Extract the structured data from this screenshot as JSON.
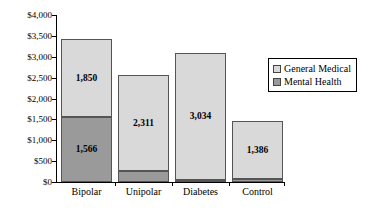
{
  "chart_data": {
    "type": "bar",
    "stacked": true,
    "title": "",
    "subtitle": "",
    "xlabel": "",
    "ylabel": "",
    "categories": [
      "Bipolar",
      "Unipolar",
      "Diabetes",
      "Control"
    ],
    "series": [
      {
        "name": "Mental Health",
        "color": "#9a9a9a",
        "values": [
          1566,
          259,
          49,
          76
        ],
        "labels": [
          "1,566",
          "259",
          "49",
          "76"
        ]
      },
      {
        "name": "General Medical",
        "color": "#d9d9d9",
        "values": [
          1850,
          2311,
          3034,
          1386
        ],
        "labels": [
          "1,850",
          "2,311",
          "3,034",
          "1,386"
        ]
      }
    ],
    "totals": [
      3416,
      2570,
      3083,
      1462
    ],
    "ylim": [
      0,
      4000
    ],
    "ytick_step": 500,
    "ytick_labels": [
      "$4,000",
      "$3,500",
      "$3,000",
      "$2,500",
      "$2,000",
      "$1,500",
      "$1,000",
      "$500",
      "$0"
    ],
    "ytick_values": [
      4000,
      3500,
      3000,
      2500,
      2000,
      1500,
      1000,
      500,
      0
    ],
    "grid": false,
    "legend_position": "right"
  },
  "legend": {
    "entries": [
      {
        "label": "General Medical",
        "color": "#d9d9d9"
      },
      {
        "label": "Mental Health",
        "color": "#9a9a9a"
      }
    ]
  }
}
